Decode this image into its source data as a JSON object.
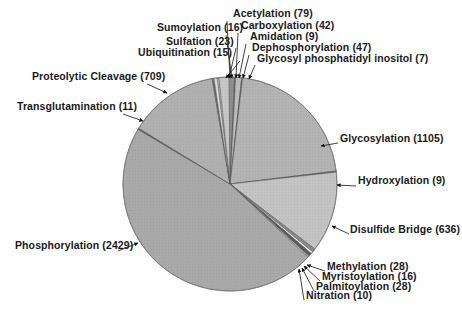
{
  "chart_data": {
    "type": "pie",
    "title": "",
    "start_angle_deg": -7.0,
    "direction": "clockwise",
    "slices": [
      {
        "label": "Sumoylation",
        "value": 16,
        "color": "#b9b9b9"
      },
      {
        "label": "Acetylation",
        "value": 79,
        "color": "#c6c6c6"
      },
      {
        "label": "Carboxylation",
        "value": 42,
        "color": "#8f8f8f"
      },
      {
        "label": "Amidation",
        "value": 9,
        "color": "#6f6f6f"
      },
      {
        "label": "Dephosphorylation",
        "value": 47,
        "color": "#bdbdbd"
      },
      {
        "label": "Glycosyl phosphatidyl inositol",
        "value": 7,
        "color": "#555555"
      },
      {
        "label": "Glycosylation",
        "value": 1105,
        "color": "#b3b3b3"
      },
      {
        "label": "Hydroxylation",
        "value": 9,
        "color": "#6a6a6a"
      },
      {
        "label": "Disulfide Bridge",
        "value": 636,
        "color": "#c3c3c3"
      },
      {
        "label": "Methylation",
        "value": 28,
        "color": "#8a8a8a"
      },
      {
        "label": "Myristoylation",
        "value": 16,
        "color": "#ffffff"
      },
      {
        "label": "Palmitoylation",
        "value": 28,
        "color": "#5c5c5c"
      },
      {
        "label": "Nitration",
        "value": 10,
        "color": "#d0d0d0"
      },
      {
        "label": "Phosphorylation",
        "value": 2429,
        "color": "#a9a9a9"
      },
      {
        "label": "Transglutamination",
        "value": 11,
        "color": "#5a5a5a"
      },
      {
        "label": "Proteolytic Cleavage",
        "value": 709,
        "color": "#b0b0b0"
      },
      {
        "label": "Ubiquitination",
        "value": 15,
        "color": "#6e6e6e"
      },
      {
        "label": "Sulfation",
        "value": 23,
        "color": "#e2e2e2"
      }
    ],
    "legend": "none (callout labels with arrows)",
    "labels": [
      {
        "text": "Acetylation (79)",
        "x": 233,
        "y": 16
      },
      {
        "text": "Sumoylation (16)",
        "x": 157,
        "y": 30
      },
      {
        "text": "Carboxylation (42)",
        "x": 241,
        "y": 28
      },
      {
        "text": "Sulfation (23)",
        "x": 166,
        "y": 44
      },
      {
        "text": "Amidation (9)",
        "x": 250,
        "y": 39
      },
      {
        "text": "Dephosphorylation (47)",
        "x": 252,
        "y": 50
      },
      {
        "text": "Ubiquitination (15)",
        "x": 138,
        "y": 55
      },
      {
        "text": "Glycosyl phosphatidyl inositol (7)",
        "x": 257,
        "y": 61
      },
      {
        "text": "Proteolytic Cleavage (709)",
        "x": 32,
        "y": 79
      },
      {
        "text": "Transglutamination (11)",
        "x": 17,
        "y": 109
      },
      {
        "text": "Glycosylation (1105)",
        "x": 340,
        "y": 141
      },
      {
        "text": "Hydroxylation (9)",
        "x": 358,
        "y": 183
      },
      {
        "text": "Disulfide Bridge (636)",
        "x": 350,
        "y": 232
      },
      {
        "text": "Methylation (28)",
        "x": 327,
        "y": 269
      },
      {
        "text": "Myristoylation (16)",
        "x": 322,
        "y": 279
      },
      {
        "text": "Palmitoylation (28)",
        "x": 316,
        "y": 289
      },
      {
        "text": "Nitration (10)",
        "x": 306,
        "y": 298
      },
      {
        "text": "Phosphorylation (2429)",
        "x": 15,
        "y": 248
      }
    ],
    "total": 5219
  },
  "pie": {
    "cx": 230,
    "cy": 184,
    "r": 107
  },
  "arrows": [
    {
      "from": [
        227,
        21
      ],
      "to": [
        230,
        78
      ]
    },
    {
      "from": [
        226,
        35
      ],
      "to": [
        232,
        78
      ]
    },
    {
      "from": [
        238,
        33
      ],
      "to": [
        236,
        78
      ]
    },
    {
      "from": [
        236,
        48
      ],
      "to": [
        229,
        78
      ]
    },
    {
      "from": [
        246,
        44
      ],
      "to": [
        239,
        78
      ]
    },
    {
      "from": [
        249,
        55
      ],
      "to": [
        243,
        78
      ]
    },
    {
      "from": [
        240,
        61
      ],
      "to": [
        226,
        78
      ]
    },
    {
      "from": [
        255,
        65
      ],
      "to": [
        249,
        79
      ]
    },
    {
      "from": [
        147,
        84
      ],
      "to": [
        167,
        93
      ]
    },
    {
      "from": [
        123,
        114
      ],
      "to": [
        143,
        121
      ]
    },
    {
      "from": [
        338,
        143
      ],
      "to": [
        321,
        146
      ]
    },
    {
      "from": [
        356,
        186
      ],
      "to": [
        337,
        185
      ]
    },
    {
      "from": [
        349,
        234
      ],
      "to": [
        332,
        226
      ]
    },
    {
      "from": [
        325,
        271
      ],
      "to": [
        307,
        265
      ]
    },
    {
      "from": [
        320,
        281
      ],
      "to": [
        304,
        266
      ]
    },
    {
      "from": [
        314,
        291
      ],
      "to": [
        302,
        268
      ]
    },
    {
      "from": [
        304,
        300
      ],
      "to": [
        299,
        269
      ]
    },
    {
      "from": [
        118,
        251
      ],
      "to": [
        138,
        243
      ]
    }
  ]
}
